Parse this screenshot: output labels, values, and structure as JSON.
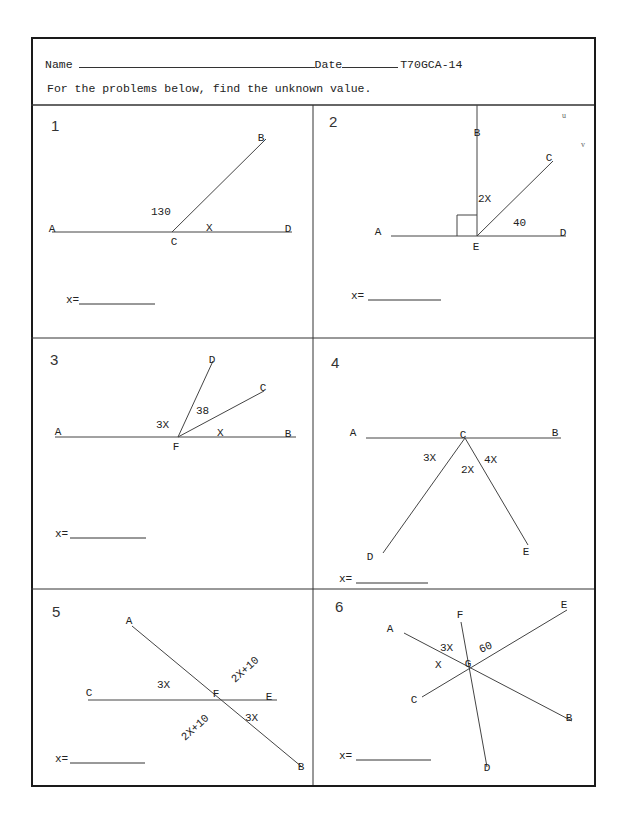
{
  "header": {
    "name_label": "Name",
    "date_label": "Date",
    "code": "T70GCA-14",
    "instructions": "For the problems below, find the unknown value."
  },
  "answer_label": "x=",
  "stray_marks": [
    {
      "text": "u",
      "x": 562,
      "y": 118
    },
    {
      "text": "v",
      "x": 581,
      "y": 147
    }
  ],
  "problems": [
    {
      "number": "1",
      "lines": [
        [
          52,
          232,
          292,
          232
        ],
        [
          172,
          232,
          266,
          139
        ]
      ],
      "points": [
        {
          "text": "A",
          "x": 52,
          "y": 232
        },
        {
          "text": "B",
          "x": 261,
          "y": 141
        },
        {
          "text": "C",
          "x": 174,
          "y": 245
        },
        {
          "text": "D",
          "x": 288,
          "y": 232
        }
      ],
      "angles": [
        {
          "text": "130",
          "x": 151,
          "y": 215
        },
        {
          "text": "X",
          "x": 206,
          "y": 231
        }
      ],
      "answer": {
        "x": 66,
        "y": 303,
        "line_x1": 79,
        "line_x2": 155
      }
    },
    {
      "number": "2",
      "lines": [
        [
          391,
          236,
          566,
          236
        ],
        [
          477,
          236,
          477,
          105
        ],
        [
          477,
          236,
          553,
          161
        ]
      ],
      "right_angle": {
        "x": 457,
        "y": 215,
        "w": 20,
        "h": 21
      },
      "points": [
        {
          "text": "A",
          "x": 378,
          "y": 235
        },
        {
          "text": "B",
          "x": 477,
          "y": 136
        },
        {
          "text": "C",
          "x": 549,
          "y": 161
        },
        {
          "text": "D",
          "x": 563,
          "y": 236
        },
        {
          "text": "E",
          "x": 476,
          "y": 250
        }
      ],
      "angles": [
        {
          "text": "2X",
          "x": 478,
          "y": 202
        },
        {
          "text": "40",
          "x": 513,
          "y": 226
        }
      ],
      "answer": {
        "x": 351,
        "y": 299,
        "line_x1": 368,
        "line_x2": 441
      }
    },
    {
      "number": "3",
      "lines": [
        [
          55,
          437,
          296,
          437
        ],
        [
          178,
          437,
          213,
          361
        ],
        [
          178,
          437,
          264,
          391
        ]
      ],
      "points": [
        {
          "text": "A",
          "x": 58,
          "y": 435
        },
        {
          "text": "B",
          "x": 288,
          "y": 437
        },
        {
          "text": "C",
          "x": 263,
          "y": 391
        },
        {
          "text": "D",
          "x": 212,
          "y": 363
        },
        {
          "text": "F",
          "x": 176,
          "y": 450
        }
      ],
      "angles": [
        {
          "text": "3X",
          "x": 156,
          "y": 428
        },
        {
          "text": "38",
          "x": 196,
          "y": 414
        },
        {
          "text": "X",
          "x": 217,
          "y": 436
        }
      ],
      "answer": {
        "x": 55,
        "y": 537,
        "line_x1": 70,
        "line_x2": 146
      }
    },
    {
      "number": "4",
      "lines": [
        [
          366,
          438,
          561,
          438
        ],
        [
          465,
          438,
          383,
          553
        ],
        [
          465,
          438,
          528,
          545
        ]
      ],
      "points": [
        {
          "text": "A",
          "x": 353,
          "y": 436
        },
        {
          "text": "B",
          "x": 555,
          "y": 436
        },
        {
          "text": "C",
          "x": 463,
          "y": 438
        },
        {
          "text": "D",
          "x": 370,
          "y": 560
        },
        {
          "text": "E",
          "x": 526,
          "y": 555
        }
      ],
      "angles": [
        {
          "text": "3X",
          "x": 423,
          "y": 461
        },
        {
          "text": "4X",
          "x": 484,
          "y": 463
        },
        {
          "text": "2X",
          "x": 461,
          "y": 473
        }
      ],
      "answer": {
        "x": 339,
        "y": 582,
        "line_x1": 356,
        "line_x2": 428
      }
    },
    {
      "number": "5",
      "lines": [
        [
          88,
          700,
          277,
          700
        ],
        [
          132,
          626,
          302,
          767
        ]
      ],
      "points": [
        {
          "text": "A",
          "x": 129,
          "y": 624
        },
        {
          "text": "B",
          "x": 301,
          "y": 770
        },
        {
          "text": "C",
          "x": 89,
          "y": 696
        },
        {
          "text": "E",
          "x": 269,
          "y": 700
        },
        {
          "text": "F",
          "x": 216,
          "y": 697
        }
      ],
      "angles": [
        {
          "text": "3X",
          "x": 157,
          "y": 688
        },
        {
          "text": "2X+10",
          "x": 235,
          "y": 683,
          "rotate": -42
        },
        {
          "text": "3X",
          "x": 245,
          "y": 721
        },
        {
          "text": "2X+10",
          "x": 185,
          "y": 741,
          "rotate": -42
        }
      ],
      "answer": {
        "x": 55,
        "y": 762,
        "line_x1": 70,
        "line_x2": 145
      }
    },
    {
      "number": "6",
      "lines": [
        [
          404,
          633,
          572,
          721
        ],
        [
          422,
          697,
          567,
          610
        ],
        [
          461,
          622,
          487,
          767
        ]
      ],
      "points": [
        {
          "text": "A",
          "x": 390,
          "y": 632
        },
        {
          "text": "B",
          "x": 569,
          "y": 721
        },
        {
          "text": "C",
          "x": 414,
          "y": 703
        },
        {
          "text": "D",
          "x": 487,
          "y": 771
        },
        {
          "text": "E",
          "x": 564,
          "y": 608
        },
        {
          "text": "F",
          "x": 460,
          "y": 618
        },
        {
          "text": "G",
          "x": 468,
          "y": 667
        }
      ],
      "angles": [
        {
          "text": "3X",
          "x": 440,
          "y": 651
        },
        {
          "text": "60",
          "x": 481,
          "y": 653,
          "rotate": -25
        },
        {
          "text": "X",
          "x": 435,
          "y": 668
        }
      ],
      "answer": {
        "x": 339,
        "y": 759,
        "line_x1": 356,
        "line_x2": 431
      }
    }
  ],
  "grid": {
    "header_divider_y": 105,
    "column_divider_x": 313,
    "row_dividers_y": [
      338,
      589
    ],
    "left": 31,
    "right": 594,
    "top": 37,
    "bottom": 785
  },
  "colors": {
    "ink": "#222222",
    "frame": "#1a1a1a",
    "paper": "#ffffff"
  }
}
